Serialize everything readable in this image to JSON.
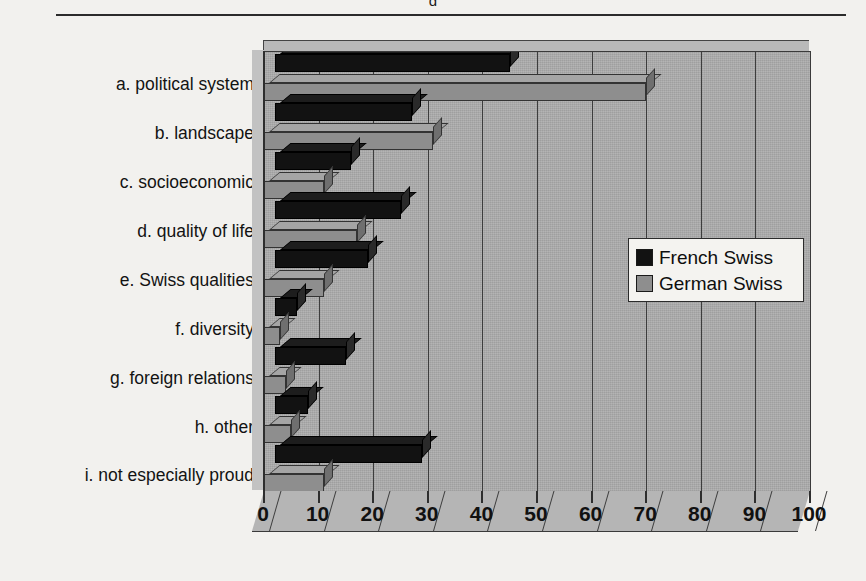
{
  "figure": {
    "clipped_title_fragment": "g",
    "axis_line_color": "#2b2b2b"
  },
  "legend": {
    "position": "inside-right",
    "entries": [
      {
        "label": "French Swiss",
        "color": "#121212",
        "swatch": "black-swatch"
      },
      {
        "label": "German Swiss",
        "color": "#8e8e8e",
        "swatch": "gray-swatch"
      }
    ]
  },
  "chart_data": {
    "type": "bar",
    "orientation": "horizontal",
    "title": "",
    "xlabel": "",
    "ylabel": "",
    "xlim": [
      0,
      100
    ],
    "xticks": [
      0,
      10,
      20,
      30,
      40,
      50,
      60,
      70,
      80,
      90,
      100
    ],
    "xtick_labels": [
      "0",
      "10",
      "20",
      "30",
      "40",
      "50",
      "60",
      "70",
      "80",
      "90",
      "100"
    ],
    "grid": true,
    "grid_axis": "x",
    "three_d": true,
    "categories": [
      "a. political system",
      "b. landscape",
      "c. socioeconomic",
      "d. quality of life",
      "e. Swiss qualities",
      "f. diversity",
      "g. foreign relations",
      "h. other",
      "i. not especially proud"
    ],
    "series": [
      {
        "name": "French Swiss",
        "color": "#121212",
        "values": [
          43,
          25,
          14,
          23,
          17,
          4,
          13,
          6,
          27
        ]
      },
      {
        "name": "German Swiss",
        "color": "#8e8e8e",
        "values": [
          70,
          31,
          11,
          17,
          11,
          3,
          4,
          5,
          11
        ]
      }
    ]
  }
}
